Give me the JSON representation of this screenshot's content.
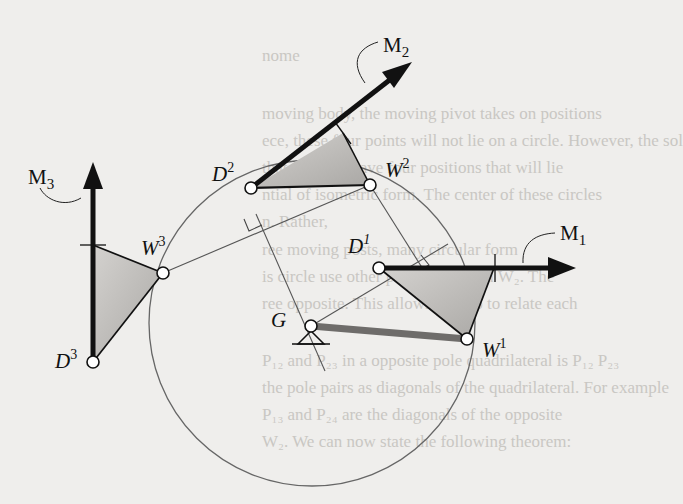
{
  "figure": {
    "labels": {
      "M1": "M",
      "M1_sub": "1",
      "M2": "M",
      "M2_sub": "2",
      "M3": "M",
      "M3_sub": "3",
      "D1": "D",
      "D1_sup": "1",
      "D2": "D",
      "D2_sup": "2",
      "D3": "D",
      "D3_sup": "3",
      "W1": "W",
      "W1_sup": "1",
      "W2": "W",
      "W2_sup": "2",
      "W3": "W",
      "W3_sup": "3",
      "G": "G"
    },
    "colors": {
      "background": "#efeeec",
      "ink": "#111111",
      "triangle_fill": "#bdbbb8",
      "ground_link": "#6e6c6a",
      "construction_line": "#555555"
    }
  },
  "background_text": {
    "lines": [
      "nome",
      "moving body, the moving pivot takes on positions",
      "ece, these four points will not lie on a circle. However, the sol",
      "that this will have four positions that will lie",
      "ntial of isometric form. The center of these circles",
      "n. Rather,",
      "ree moving posts, many circular form",
      "is circle use other point W₁ - from W₂. The",
      "ree opposite. This allows us also to relate each",
      "P₁₂ and P₂₃ in a opposite pole quadrilateral is P₁₂ P₂₃",
      "the pole pairs as diagonals of the quadrilateral. For example",
      "P₁₃ and P₂₄ are the diagonals of the opposite",
      "W₂. We can now state the following theorem:"
    ]
  }
}
